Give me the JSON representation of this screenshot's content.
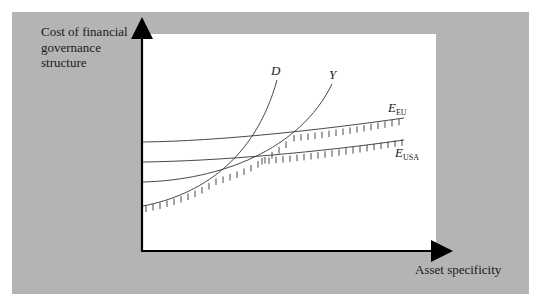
{
  "diagram": {
    "y_axis_label": "Cost of financial governance structure",
    "y_axis_label_lines": [
      "Cost of financial",
      "governance",
      "structure"
    ],
    "x_axis_label": "Asset specificity",
    "curves": [
      {
        "id": "D",
        "label": "D",
        "subscript": "",
        "shape": "convex, steep"
      },
      {
        "id": "Y",
        "label": "Y",
        "subscript": "",
        "shape": "convex"
      },
      {
        "id": "E_EU",
        "label": "E",
        "subscript": "EU",
        "shape": "nearly flat, slight upward slope"
      },
      {
        "id": "E_USA",
        "label": "E",
        "subscript": "USA",
        "shape": "nearly flat, slight upward slope"
      }
    ],
    "intercepts_order_top_to_bottom": [
      "E_EU",
      "E_USA",
      "Y",
      "D"
    ],
    "hatched_envelope": "lower envelope of minimum-cost governance structures (hatched underside)",
    "colors": {
      "frame_background": "#b4b4b4",
      "plot_background": "#ffffff",
      "line": "#333333",
      "axis": "#000000"
    }
  }
}
